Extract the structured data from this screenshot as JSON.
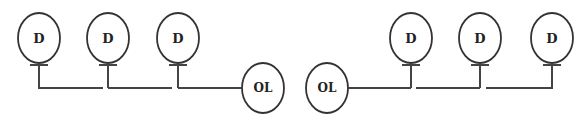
{
  "diagram": {
    "colors": {
      "stroke": "#333333",
      "background": "#ffffff"
    },
    "left_group": {
      "devices": [
        {
          "label": "D",
          "cx": 39,
          "cy": 38
        },
        {
          "label": "D",
          "cx": 108,
          "cy": 38
        },
        {
          "label": "D",
          "cx": 178,
          "cy": 38
        }
      ],
      "terminal": {
        "label": "OL",
        "cx": 263,
        "cy": 88
      }
    },
    "right_group": {
      "terminal": {
        "label": "OL",
        "cx": 327,
        "cy": 88
      },
      "devices": [
        {
          "label": "D",
          "cx": 411,
          "cy": 38
        },
        {
          "label": "D",
          "cx": 480,
          "cy": 38
        },
        {
          "label": "D",
          "cx": 552,
          "cy": 38
        }
      ]
    }
  }
}
